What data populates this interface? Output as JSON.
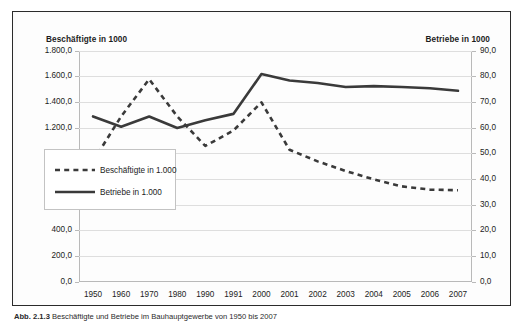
{
  "chart_data": {
    "type": "line",
    "title": "",
    "xlabel": "",
    "ylabel": "Beschäftigte in 1000",
    "y2label": "Betriebe in 1000",
    "ylim": [
      0,
      1800
    ],
    "y2lim": [
      0,
      90
    ],
    "grid": true,
    "legend_position": "inside-left",
    "categories": [
      "1950",
      "1960",
      "1970",
      "1980",
      "1990",
      "1991",
      "2000",
      "2001",
      "2002",
      "2003",
      "2004",
      "2005",
      "2006",
      "2007"
    ],
    "left_axis_ticks": [
      "0,0",
      "200,0",
      "400,0",
      "600,0",
      "800,0",
      "1.000,0",
      "1.200,0",
      "1.400,0",
      "1.600,0",
      "1.800,0"
    ],
    "right_axis_ticks": [
      "0,0",
      "10,0",
      "20,0",
      "30,0",
      "40,0",
      "50,0",
      "60,0",
      "70,0",
      "80,0",
      "90,0"
    ],
    "series": [
      {
        "name": "Beschäftigte in 1.000",
        "axis": "left",
        "style": "dashed",
        "color": "#3a3a3a",
        "values": [
          940,
          1290,
          1580,
          1290,
          1060,
          1180,
          1400,
          1030,
          940,
          865,
          800,
          745,
          720,
          715
        ]
      },
      {
        "name": "Betriebe in 1.000",
        "axis": "right",
        "style": "solid",
        "color": "#3a3a3a",
        "values": [
          64.5,
          60.5,
          64.5,
          60.0,
          63.0,
          65.5,
          81.0,
          78.5,
          77.5,
          76.0,
          76.3,
          76.0,
          75.5,
          74.5
        ]
      }
    ]
  },
  "labels": {
    "left_axis_title": "Beschäftigte in 1000",
    "right_axis_title": "Betriebe in 1000"
  },
  "legend": {
    "items": [
      {
        "label": "Beschäftigte in 1.000",
        "style": "dashed"
      },
      {
        "label": "Betriebe in 1.000",
        "style": "solid"
      }
    ]
  },
  "caption": {
    "number": "Abb. 2.1.3",
    "text": "Beschäftigte und Betriebe im Bauhauptgewerbe von 1950 bis 2007"
  }
}
